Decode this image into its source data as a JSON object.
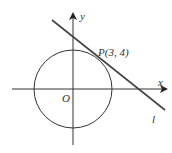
{
  "diagram": {
    "title": "",
    "labels": {
      "x_axis": "x",
      "y_axis": "y",
      "origin": "O",
      "point": "P(3, 4)",
      "line": "l"
    },
    "elements": {
      "circle": {
        "center": [
          0,
          0
        ],
        "radius": 5
      },
      "tangent_point": [
        3,
        4
      ],
      "tangent_line": "l"
    },
    "colors": {
      "stroke": "#333333",
      "line": "#444444",
      "background": "#ffffff"
    }
  }
}
